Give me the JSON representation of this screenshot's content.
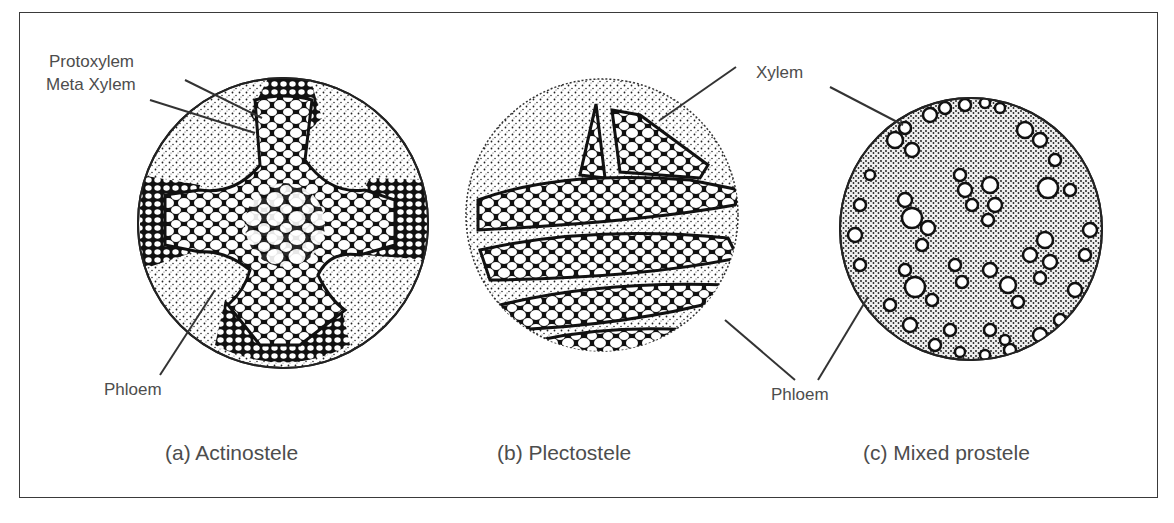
{
  "figure": {
    "panels": [
      {
        "id": "a",
        "caption": "(a) Actinostele",
        "labels": {
          "protoxylem": "Protoxylem",
          "metaxylem": "Meta Xylem",
          "phloem": "Phloem"
        }
      },
      {
        "id": "b",
        "caption": "(b) Plectostele",
        "labels": {
          "xylem": "Xylem",
          "phloem": "Phloem"
        }
      },
      {
        "id": "c",
        "caption": "(c) Mixed prostele",
        "labels": {}
      }
    ],
    "shared_labels": {
      "xylem": "Xylem",
      "phloem": "Phloem"
    },
    "colors": {
      "ink": "#1a1a1a",
      "text": "#4d4d4d",
      "background": "#ffffff",
      "frame": "#3a3a3a"
    }
  }
}
